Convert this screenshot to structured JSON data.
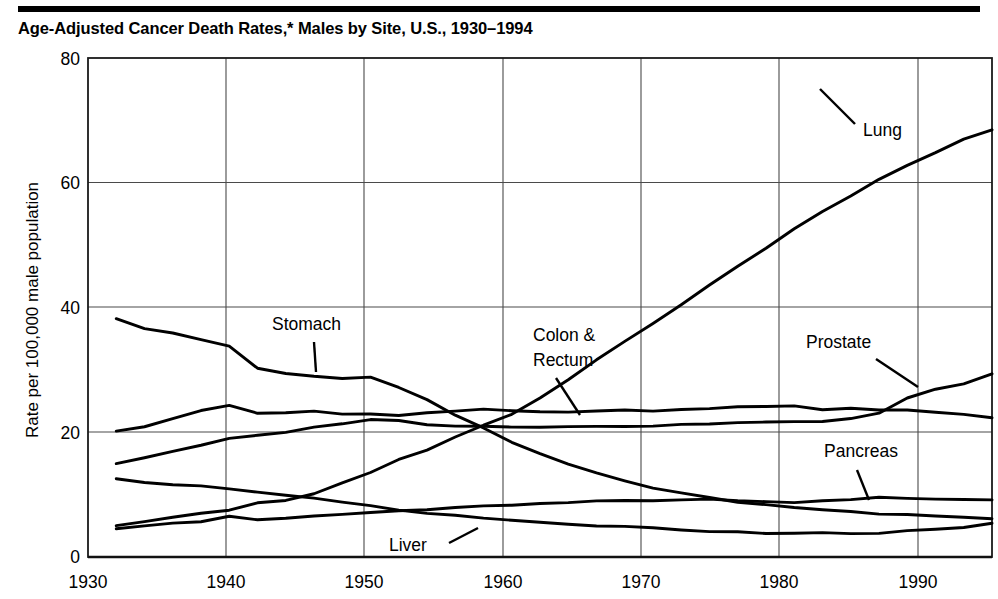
{
  "header": {
    "title": "Age-Adjusted Cancer Death Rates,* Males by Site, U.S., 1930–1994"
  },
  "chart_data": {
    "type": "line",
    "title": "Age-Adjusted Cancer Death Rates,* Males by Site, U.S., 1930–1994",
    "xlabel": "",
    "ylabel": "Rate per 100,000 male population",
    "xlim": [
      1930,
      1994
    ],
    "ylim": [
      0,
      80
    ],
    "grid": true,
    "legend_position": "inline-annotations",
    "xticks": [
      1930,
      1940,
      1950,
      1960,
      1970,
      1980,
      1990
    ],
    "xticklabels": [
      "1930",
      "1940",
      "1950",
      "1960",
      "1970",
      "1980",
      "1990"
    ],
    "yticks": [
      0,
      20,
      40,
      60,
      80
    ],
    "yticklabels": [
      "0",
      "20",
      "40",
      "60",
      "80"
    ],
    "x": [
      1932,
      1934,
      1936,
      1938,
      1940,
      1942,
      1944,
      1946,
      1948,
      1950,
      1952,
      1954,
      1956,
      1958,
      1960,
      1962,
      1964,
      1966,
      1968,
      1970,
      1972,
      1974,
      1976,
      1978,
      1980,
      1982,
      1984,
      1986,
      1988,
      1990,
      1992,
      1994
    ],
    "series": [
      {
        "name": "Lung",
        "label": "Lung",
        "values": [
          5.0,
          5.6,
          6.3,
          6.9,
          7.5,
          8.6,
          9.0,
          10.2,
          11.8,
          13.5,
          15.6,
          17.2,
          19.3,
          21.2,
          22.8,
          25.6,
          28.4,
          31.5,
          34.5,
          37.5,
          40.5,
          43.5,
          46.5,
          49.5,
          52.5,
          55.5,
          58.0,
          60.5,
          62.8,
          64.8,
          67.0,
          68.5
        ]
      },
      {
        "name": "Stomach",
        "label": "Stomach",
        "values": [
          38.2,
          36.5,
          35.8,
          34.8,
          33.8,
          30.2,
          29.5,
          29.0,
          28.5,
          28.8,
          27.3,
          25.3,
          22.7,
          20.8,
          18.5,
          16.5,
          15.0,
          13.6,
          12.2,
          11.0,
          10.2,
          9.5,
          8.8,
          8.3,
          7.9,
          7.5,
          7.2,
          7.0,
          6.8,
          6.6,
          6.4,
          6.2
        ]
      },
      {
        "name": "Colon & Rectum",
        "label": "Colon &\nRectum",
        "values": [
          20.2,
          21.0,
          22.3,
          23.5,
          24.3,
          23.0,
          23.1,
          23.4,
          23.0,
          22.9,
          22.7,
          23.2,
          23.5,
          23.6,
          23.5,
          23.3,
          23.2,
          23.5,
          23.6,
          23.5,
          23.7,
          23.8,
          24.0,
          24.2,
          24.3,
          23.6,
          23.8,
          23.6,
          23.5,
          23.3,
          22.9,
          22.2
        ]
      },
      {
        "name": "Prostate",
        "label": "Prostate",
        "values": [
          15.0,
          16.0,
          17.0,
          18.0,
          19.0,
          19.5,
          20.1,
          20.8,
          21.4,
          22.0,
          21.8,
          21.3,
          21.0,
          20.9,
          20.8,
          20.9,
          21.0,
          21.0,
          21.0,
          21.0,
          21.2,
          21.4,
          21.6,
          21.6,
          21.6,
          21.8,
          22.2,
          23.0,
          25.4,
          26.8,
          27.8,
          29.3
        ]
      },
      {
        "name": "Liver",
        "label": "Liver",
        "values": [
          12.6,
          12.0,
          11.6,
          11.3,
          10.9,
          10.4,
          9.9,
          9.4,
          8.8,
          8.2,
          7.6,
          7.1,
          6.6,
          6.2,
          5.8,
          5.5,
          5.2,
          5.0,
          4.8,
          4.6,
          4.4,
          4.2,
          4.0,
          3.9,
          3.8,
          3.8,
          3.8,
          3.9,
          4.1,
          4.4,
          4.8,
          5.4
        ]
      },
      {
        "name": "Pancreas",
        "label": "Pancreas",
        "values": [
          4.6,
          5.0,
          5.4,
          5.6,
          6.5,
          6.0,
          6.1,
          6.5,
          6.8,
          7.1,
          7.4,
          7.7,
          8.0,
          8.2,
          8.4,
          8.6,
          8.8,
          9.0,
          9.0,
          9.1,
          9.1,
          9.2,
          9.1,
          8.9,
          8.8,
          9.0,
          9.3,
          9.6,
          9.5,
          9.3,
          9.3,
          9.2
        ]
      }
    ],
    "annotations": [
      {
        "text": "Lung",
        "x": 1987,
        "y": 63
      },
      {
        "text": "Stomach",
        "x": 1946,
        "y": 43
      },
      {
        "text": "Colon & Rectum",
        "x": 1962,
        "y": 40
      },
      {
        "text": "Prostate",
        "x": 1983,
        "y": 41
      },
      {
        "text": "Pancreas",
        "x": 1984,
        "y": 23
      },
      {
        "text": "Liver",
        "x": 1952,
        "y": 3
      }
    ]
  },
  "labels": {
    "y_axis": "Rate per 100,000 male population",
    "lung": "Lung",
    "stomach": "Stomach",
    "colon_line1": "Colon &",
    "colon_line2": "Rectum",
    "prostate": "Prostate",
    "pancreas": "Pancreas",
    "liver": "Liver",
    "y0": "0",
    "y20": "20",
    "y40": "40",
    "y60": "60",
    "y80": "80",
    "x1930": "1930",
    "x1940": "1940",
    "x1950": "1950",
    "x1960": "1960",
    "x1970": "1970",
    "x1980": "1980",
    "x1990": "1990"
  },
  "colors": {
    "line": "#000000",
    "grid": "#4a4a4a",
    "frame": "#1a1a1a",
    "background": "#ffffff"
  }
}
